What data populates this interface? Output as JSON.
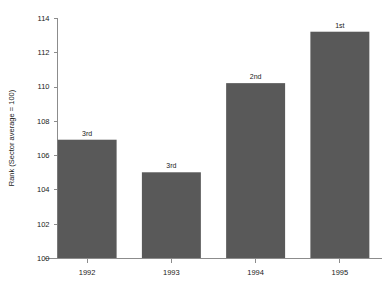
{
  "chart_data": {
    "type": "bar",
    "title": "",
    "xlabel": "",
    "ylabel": "Rank (Sector average = 100)",
    "categories": [
      "1992",
      "1993",
      "1994",
      "1995"
    ],
    "values": [
      106.9,
      105.0,
      110.2,
      113.2
    ],
    "point_labels": [
      "3rd",
      "3rd",
      "2nd",
      "1st"
    ],
    "ylim": [
      100,
      114
    ],
    "yticks": [
      100,
      102,
      104,
      106,
      108,
      110,
      112,
      114
    ],
    "ytick_labels": [
      "100",
      "102",
      "104",
      "106",
      "108",
      "110",
      "112",
      "114"
    ],
    "grid": false,
    "legend": false,
    "bar_color": "#595959",
    "axis_color": "#8c8c8c",
    "text_color": "#1a1a1a",
    "background": "#ffffff"
  },
  "axes": {
    "y_title": "Rank (Sector average = 100)"
  },
  "bars": [
    {
      "category": "1992",
      "value": 106.9,
      "label": "3rd"
    },
    {
      "category": "1993",
      "value": 105.0,
      "label": "3rd"
    },
    {
      "category": "1994",
      "value": 110.2,
      "label": "2nd"
    },
    {
      "category": "1995",
      "value": 113.2,
      "label": "1st"
    }
  ]
}
